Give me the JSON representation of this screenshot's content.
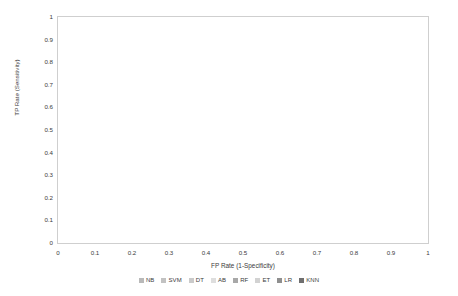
{
  "chart_data": {
    "type": "line",
    "title": "",
    "xlabel": "FP Rate (1-Specificity)",
    "ylabel": "TP Rate (Sensitivity)",
    "xlim": [
      0,
      1
    ],
    "ylim": [
      0,
      1
    ],
    "grid": true,
    "legend_position": "bottom",
    "xticks": [
      "0",
      "0.1",
      "0.2",
      "0.3",
      "0.4",
      "0.5",
      "0.6",
      "0.7",
      "0.8",
      "0.9",
      "1"
    ],
    "yticks": [
      "0",
      "0.1",
      "0.2",
      "0.3",
      "0.4",
      "0.5",
      "0.6",
      "0.7",
      "0.8",
      "0.9",
      "1"
    ],
    "xtick_values": [
      0,
      0.1,
      0.2,
      0.3,
      0.4,
      0.5,
      0.6,
      0.7,
      0.8,
      0.9,
      1
    ],
    "ytick_values": [
      0,
      0.1,
      0.2,
      0.3,
      0.4,
      0.5,
      0.6,
      0.7,
      0.8,
      0.9,
      1
    ],
    "annotations": [],
    "series": [
      {
        "name": "NB",
        "color": "#b9b9b9",
        "width": 0.9,
        "points": [
          [
            0,
            0
          ],
          [
            0.004,
            0.1
          ],
          [
            0.008,
            0.18
          ],
          [
            0.012,
            0.24
          ],
          [
            0.018,
            0.3
          ],
          [
            0.024,
            0.35
          ],
          [
            0.032,
            0.4
          ],
          [
            0.042,
            0.45
          ],
          [
            0.055,
            0.5
          ],
          [
            0.07,
            0.545
          ],
          [
            0.09,
            0.59
          ],
          [
            0.11,
            0.625
          ],
          [
            0.135,
            0.655
          ],
          [
            0.16,
            0.685
          ],
          [
            0.19,
            0.715
          ],
          [
            0.225,
            0.745
          ],
          [
            0.26,
            0.772
          ],
          [
            0.3,
            0.795
          ],
          [
            0.345,
            0.818
          ],
          [
            0.4,
            0.845
          ],
          [
            0.46,
            0.872
          ],
          [
            0.53,
            0.897
          ],
          [
            0.6,
            0.918
          ],
          [
            0.68,
            0.94
          ],
          [
            0.77,
            0.96
          ],
          [
            0.87,
            0.98
          ],
          [
            1,
            1
          ]
        ]
      },
      {
        "name": "SVM",
        "color": "#c2c2c2",
        "width": 0.9,
        "points": [
          [
            0,
            0
          ],
          [
            0.003,
            0.08
          ],
          [
            0.007,
            0.15
          ],
          [
            0.011,
            0.22
          ],
          [
            0.016,
            0.285
          ],
          [
            0.023,
            0.34
          ],
          [
            0.031,
            0.39
          ],
          [
            0.041,
            0.44
          ],
          [
            0.054,
            0.487
          ],
          [
            0.069,
            0.532
          ],
          [
            0.087,
            0.573
          ],
          [
            0.108,
            0.61
          ],
          [
            0.132,
            0.645
          ],
          [
            0.158,
            0.676
          ],
          [
            0.188,
            0.706
          ],
          [
            0.222,
            0.735
          ],
          [
            0.258,
            0.762
          ],
          [
            0.3,
            0.79
          ],
          [
            0.35,
            0.816
          ],
          [
            0.41,
            0.845
          ],
          [
            0.47,
            0.872
          ],
          [
            0.54,
            0.897
          ],
          [
            0.62,
            0.921
          ],
          [
            0.7,
            0.943
          ],
          [
            0.8,
            0.965
          ],
          [
            0.9,
            0.984
          ],
          [
            1,
            1
          ]
        ]
      },
      {
        "name": "DT",
        "color": "#cacaca",
        "width": 0.9,
        "points": [
          [
            0,
            0
          ],
          [
            0.005,
            0.12
          ],
          [
            0.01,
            0.2
          ],
          [
            0.015,
            0.27
          ],
          [
            0.021,
            0.325
          ],
          [
            0.029,
            0.378
          ],
          [
            0.039,
            0.425
          ],
          [
            0.051,
            0.472
          ],
          [
            0.066,
            0.516
          ],
          [
            0.084,
            0.556
          ],
          [
            0.105,
            0.592
          ],
          [
            0.13,
            0.625
          ],
          [
            0.157,
            0.656
          ],
          [
            0.187,
            0.686
          ],
          [
            0.22,
            0.714
          ],
          [
            0.256,
            0.742
          ],
          [
            0.296,
            0.768
          ],
          [
            0.34,
            0.793
          ],
          [
            0.39,
            0.82
          ],
          [
            0.45,
            0.848
          ],
          [
            0.52,
            0.876
          ],
          [
            0.59,
            0.902
          ],
          [
            0.67,
            0.927
          ],
          [
            0.76,
            0.951
          ],
          [
            0.86,
            0.974
          ],
          [
            1,
            1
          ]
        ]
      },
      {
        "name": "AB",
        "color": "#dedede",
        "width": 0.9,
        "points": [
          [
            0,
            0
          ],
          [
            0.004,
            0.09
          ],
          [
            0.009,
            0.17
          ],
          [
            0.014,
            0.235
          ],
          [
            0.02,
            0.295
          ],
          [
            0.027,
            0.35
          ],
          [
            0.036,
            0.4
          ],
          [
            0.047,
            0.45
          ],
          [
            0.061,
            0.497
          ],
          [
            0.078,
            0.54
          ],
          [
            0.098,
            0.58
          ],
          [
            0.12,
            0.615
          ],
          [
            0.146,
            0.648
          ],
          [
            0.175,
            0.678
          ],
          [
            0.207,
            0.708
          ],
          [
            0.243,
            0.737
          ],
          [
            0.282,
            0.765
          ],
          [
            0.325,
            0.791
          ],
          [
            0.375,
            0.818
          ],
          [
            0.432,
            0.846
          ],
          [
            0.5,
            0.874
          ],
          [
            0.575,
            0.9
          ],
          [
            0.655,
            0.925
          ],
          [
            0.745,
            0.95
          ],
          [
            0.85,
            0.975
          ],
          [
            1,
            1
          ]
        ]
      },
      {
        "name": "RF",
        "color": "#a8a8a8",
        "width": 0.9,
        "points": [
          [
            0,
            0
          ],
          [
            0.25,
            0.665
          ],
          [
            0.295,
            0.697
          ],
          [
            0.345,
            0.725
          ],
          [
            0.4,
            0.757
          ],
          [
            0.43,
            0.77
          ],
          [
            0.52,
            0.8
          ],
          [
            0.62,
            0.845
          ],
          [
            0.72,
            0.885
          ],
          [
            0.82,
            0.925
          ],
          [
            0.91,
            0.962
          ],
          [
            1,
            1
          ]
        ]
      },
      {
        "name": "ET",
        "color": "#d2d2d2",
        "width": 0.9,
        "points": [
          [
            0,
            0
          ],
          [
            0.004,
            0.11
          ],
          [
            0.009,
            0.19
          ],
          [
            0.014,
            0.255
          ],
          [
            0.02,
            0.315
          ],
          [
            0.028,
            0.368
          ],
          [
            0.038,
            0.418
          ],
          [
            0.05,
            0.465
          ],
          [
            0.064,
            0.51
          ],
          [
            0.081,
            0.552
          ],
          [
            0.101,
            0.59
          ],
          [
            0.124,
            0.624
          ],
          [
            0.15,
            0.655
          ],
          [
            0.18,
            0.686
          ],
          [
            0.213,
            0.715
          ],
          [
            0.25,
            0.744
          ],
          [
            0.29,
            0.771
          ],
          [
            0.335,
            0.797
          ],
          [
            0.385,
            0.823
          ],
          [
            0.44,
            0.851
          ],
          [
            0.505,
            0.879
          ],
          [
            0.58,
            0.905
          ],
          [
            0.66,
            0.93
          ],
          [
            0.75,
            0.955
          ],
          [
            0.86,
            0.978
          ],
          [
            1,
            1
          ]
        ]
      },
      {
        "name": "LR",
        "color": "#8f8f8f",
        "width": 1.0,
        "points": [
          [
            0,
            0
          ],
          [
            0.43,
            0.893
          ],
          [
            0.5,
            0.912
          ],
          [
            0.58,
            0.93
          ],
          [
            0.67,
            0.949
          ],
          [
            0.78,
            0.968
          ],
          [
            0.89,
            0.986
          ],
          [
            1,
            1
          ]
        ]
      },
      {
        "name": "KNN",
        "color": "#6f6f6f",
        "width": 1.1,
        "points": [
          [
            0,
            0
          ],
          [
            0.385,
            0.768
          ],
          [
            0.5,
            0.806
          ],
          [
            0.62,
            0.846
          ],
          [
            0.74,
            0.888
          ],
          [
            0.86,
            0.93
          ],
          [
            1,
            1
          ]
        ]
      }
    ],
    "chance_line": {
      "name": "chance-diagonal",
      "color": "#e6e6e6",
      "points": [
        [
          0,
          0
        ],
        [
          1,
          1
        ]
      ]
    }
  },
  "legend": {
    "items": [
      {
        "label": "NB",
        "color": "#b9b9b9"
      },
      {
        "label": "SVM",
        "color": "#c2c2c2"
      },
      {
        "label": "DT",
        "color": "#cacaca"
      },
      {
        "label": "AB",
        "color": "#dedede"
      },
      {
        "label": "RF",
        "color": "#a8a8a8"
      },
      {
        "label": "ET",
        "color": "#d2d2d2"
      },
      {
        "label": "LR",
        "color": "#8f8f8f"
      },
      {
        "label": "KNN",
        "color": "#6f6f6f"
      }
    ]
  },
  "style": {
    "background": "#ffffff",
    "grid_color": "#ebebeb",
    "axis_color": "#cfcfcf",
    "text_color": "#3b3b3b"
  }
}
